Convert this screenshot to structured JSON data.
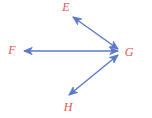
{
  "figure": {
    "background_color": "#ffffff",
    "width": 152,
    "height": 118,
    "line_color": "#5a78ce",
    "label_color": "#e0544f",
    "line_width": 1.4,
    "vertex": {
      "name": "G",
      "x": 119,
      "y": 52
    },
    "labels": [
      {
        "id": "label-e",
        "text": "E",
        "x": 66,
        "y": 7
      },
      {
        "id": "label-f",
        "text": "F",
        "x": 12,
        "y": 50
      },
      {
        "id": "label-g",
        "text": "G",
        "x": 129,
        "y": 52
      },
      {
        "id": "label-h",
        "text": "H",
        "x": 68,
        "y": 107
      }
    ],
    "segments": [
      {
        "id": "segment-ge",
        "from": "G",
        "to": "E",
        "x1": 118,
        "y1": 49,
        "x2": 73,
        "y2": 17,
        "arrow_start": true,
        "arrow_end": true
      },
      {
        "id": "segment-gf",
        "from": "G",
        "to": "F",
        "x1": 118,
        "y1": 51,
        "x2": 24,
        "y2": 51,
        "arrow_start": true,
        "arrow_end": true
      },
      {
        "id": "segment-gh",
        "from": "G",
        "to": "H",
        "x1": 118,
        "y1": 55,
        "x2": 69,
        "y2": 95,
        "arrow_start": true,
        "arrow_end": true
      }
    ]
  }
}
